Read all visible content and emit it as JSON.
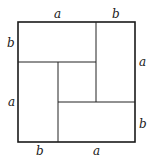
{
  "diagram": {
    "colors": {
      "stroke": "#222222",
      "background": "#ffffff"
    },
    "labels": {
      "top_a": "a",
      "top_b": "b",
      "left_b": "b",
      "left_a": "a",
      "right_a": "a",
      "right_b": "b",
      "bottom_b": "b",
      "bottom_a": "a"
    }
  }
}
